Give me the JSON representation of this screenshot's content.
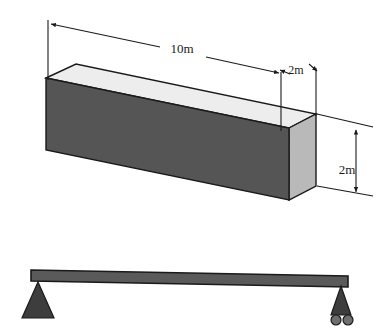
{
  "figure": {
    "background_color": "#ffffff"
  },
  "prism": {
    "name": "rectangular-beam-prism",
    "faces": {
      "front": {
        "label": "front-face",
        "fill": "#555555",
        "points": "46,78 289,128 289,200 46,150"
      },
      "top": {
        "label": "top-face",
        "fill": "#ededed",
        "points": "46,78 76,64 316,114 289,128"
      },
      "right": {
        "label": "right-end-face",
        "fill": "#b9b9b9",
        "points": "289,128 316,114 316,186 289,200"
      }
    },
    "edge_color": "#1a1a1a",
    "edge_width": 1.4
  },
  "dimensions": {
    "length": {
      "id": "length-dimension",
      "value": "10m",
      "label_x": 182,
      "label_y": 53,
      "extension_left": {
        "x1": 48,
        "y1": 20,
        "x2": 48,
        "y2": 80
      },
      "extension_right": {
        "x1": 281,
        "y1": 70,
        "x2": 281,
        "y2": 130
      },
      "leader_left": {
        "x1": 50,
        "y1": 24,
        "x2": 160,
        "y2": 47
      },
      "leader_right": {
        "x1": 206,
        "y1": 57,
        "x2": 279,
        "y2": 72
      }
    },
    "width": {
      "id": "width-dimension",
      "value": "2m",
      "label_x": 296,
      "label_y": 75,
      "extension_left": {
        "x1": 281,
        "y1": 70,
        "x2": 281,
        "y2": 130
      },
      "extension_right": {
        "x1": 316,
        "y1": 66,
        "x2": 316,
        "y2": 116
      },
      "leader_left": {
        "x1": 275,
        "y1": 78,
        "x2": 288,
        "y2": 72
      },
      "leader_right": {
        "x1": 310,
        "y1": 68,
        "x2": 318,
        "y2": 74
      }
    },
    "height": {
      "id": "height-dimension",
      "value": "2m",
      "label_x": 347,
      "label_y": 170,
      "line": {
        "x1": 356,
        "y1": 133,
        "x2": 356,
        "y2": 189
      },
      "leader_top": {
        "x1": 317,
        "y1": 114,
        "x2": 372,
        "y2": 127
      },
      "leader_bottom": {
        "x1": 317,
        "y1": 186,
        "x2": 372,
        "y2": 196
      }
    }
  },
  "beam_schematic": {
    "name": "simply-supported-beam",
    "beam": {
      "label": "beam-member",
      "fill": "#5a5a5a",
      "stroke": "#1a1a1a",
      "points": "31,270 348,276 348,287 31,281"
    },
    "supports": [
      {
        "id": "pin-support-left",
        "type": "pin",
        "fill": "#3d3d3d",
        "triangle": "38,282 22,318 54,318",
        "base": {
          "x1": 20,
          "y1": 317,
          "x2": 56,
          "y2": 317
        }
      },
      {
        "id": "roller-support-right",
        "type": "roller",
        "fill": "#3d3d3d",
        "triangle": "341,286 331,315 351,315",
        "rollers": [
          {
            "cx": 336,
            "cy": 320,
            "r": 5
          },
          {
            "cx": 348,
            "cy": 320,
            "r": 5
          }
        ]
      }
    ]
  }
}
